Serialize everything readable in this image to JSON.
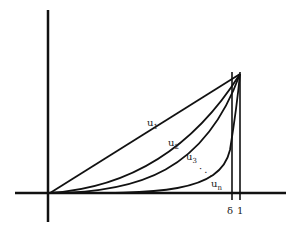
{
  "diagram": {
    "curves": [
      {
        "label": "u",
        "subscript": "1",
        "shape": "linear"
      },
      {
        "label": "u",
        "subscript": "2",
        "shape": "quadratic"
      },
      {
        "label": "u",
        "subscript": "3",
        "shape": "cubic"
      },
      {
        "label": "u",
        "subscript": "n",
        "shape": "high-power"
      }
    ],
    "ellipsis": "· · ·",
    "x_ticks": [
      {
        "label": "δ"
      },
      {
        "label": "1"
      }
    ],
    "colors": {
      "line": "#111111",
      "background": "#ffffff"
    }
  }
}
